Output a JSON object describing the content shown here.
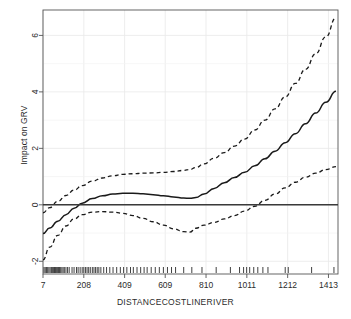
{
  "chart_data": {
    "type": "line",
    "title": "",
    "xlabel": "DISTANCECOSTLINERIVER",
    "ylabel": "Impact on GRV",
    "xlim": [
      7,
      1460
    ],
    "ylim": [
      -2.45,
      6.9
    ],
    "xticks": [
      7,
      208,
      409,
      609,
      810,
      1011,
      1212,
      1413
    ],
    "xticklabels": [
      "7",
      "208",
      "409",
      "609",
      "810",
      "1011",
      "1212",
      "1413"
    ],
    "yticks": [
      -2,
      0,
      2,
      4,
      6
    ],
    "yticklabels": [
      "-2",
      "0",
      "2",
      "4",
      "6"
    ],
    "grid": true,
    "grid_color": "#e8e8e8",
    "legend": "none",
    "line_color": "#1a1a1a",
    "series": [
      {
        "name": "Smoothed effect (GAM fit)",
        "style": "solid",
        "x": [
          7,
          40,
          80,
          120,
          160,
          200,
          250,
          300,
          350,
          400,
          450,
          500,
          550,
          600,
          650,
          700,
          730,
          760,
          800,
          850,
          900,
          950,
          1000,
          1050,
          1100,
          1150,
          1200,
          1250,
          1300,
          1350,
          1400,
          1450
        ],
        "values": [
          -1.02,
          -0.82,
          -0.58,
          -0.35,
          -0.12,
          0.06,
          0.22,
          0.32,
          0.38,
          0.41,
          0.41,
          0.39,
          0.36,
          0.32,
          0.28,
          0.24,
          0.23,
          0.26,
          0.38,
          0.58,
          0.78,
          0.97,
          1.15,
          1.38,
          1.63,
          1.9,
          2.2,
          2.52,
          2.87,
          3.25,
          3.63,
          4.02
        ]
      },
      {
        "name": "Upper 95% confidence band",
        "style": "dashed",
        "x": [
          7,
          40,
          80,
          120,
          160,
          200,
          250,
          300,
          350,
          400,
          450,
          500,
          550,
          600,
          650,
          700,
          730,
          760,
          800,
          850,
          900,
          950,
          1000,
          1050,
          1100,
          1150,
          1200,
          1250,
          1300,
          1350,
          1400,
          1450
        ],
        "values": [
          -0.28,
          -0.1,
          0.12,
          0.33,
          0.52,
          0.68,
          0.84,
          0.95,
          1.03,
          1.08,
          1.1,
          1.12,
          1.13,
          1.15,
          1.18,
          1.22,
          1.25,
          1.32,
          1.45,
          1.65,
          1.85,
          2.08,
          2.33,
          2.65,
          3.0,
          3.4,
          3.82,
          4.3,
          4.8,
          5.35,
          5.95,
          6.62
        ]
      },
      {
        "name": "Lower 95% confidence band",
        "style": "dashed",
        "x": [
          7,
          40,
          80,
          120,
          160,
          200,
          250,
          300,
          350,
          400,
          450,
          500,
          550,
          600,
          650,
          700,
          730,
          760,
          800,
          850,
          900,
          950,
          1000,
          1050,
          1100,
          1150,
          1200,
          1250,
          1300,
          1350,
          1400,
          1450
        ],
        "values": [
          -1.95,
          -1.5,
          -1.08,
          -0.75,
          -0.5,
          -0.35,
          -0.26,
          -0.24,
          -0.26,
          -0.3,
          -0.38,
          -0.48,
          -0.6,
          -0.72,
          -0.85,
          -0.95,
          -0.97,
          -0.83,
          -0.72,
          -0.62,
          -0.5,
          -0.38,
          -0.22,
          -0.05,
          0.16,
          0.38,
          0.6,
          0.8,
          0.98,
          1.12,
          1.25,
          1.35
        ]
      },
      {
        "name": "Zero reference line",
        "style": "solid-horizontal",
        "value": 0
      }
    ],
    "rug": {
      "label": "data-rug-marks",
      "x": [
        12,
        18,
        24,
        30,
        36,
        42,
        48,
        52,
        56,
        60,
        64,
        68,
        72,
        76,
        80,
        84,
        88,
        94,
        100,
        106,
        112,
        120,
        128,
        136,
        150,
        160,
        172,
        180,
        190,
        200,
        208,
        216,
        224,
        232,
        240,
        250,
        258,
        266,
        274,
        282,
        292,
        306,
        320,
        336,
        352,
        370,
        388,
        404,
        420,
        438,
        452,
        470,
        488,
        505,
        520,
        540,
        560,
        580,
        600,
        620,
        640,
        660,
        700,
        740,
        790,
        860,
        930,
        975,
        995,
        1010,
        1025,
        1045,
        1065,
        1090,
        1115,
        1200,
        1215,
        1330,
        1440
      ]
    }
  }
}
